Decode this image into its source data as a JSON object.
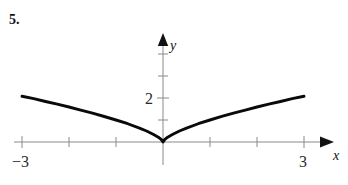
{
  "figure": {
    "problem_number": "5.",
    "axis_labels": {
      "x": "x",
      "y": "y"
    },
    "tick_labels": {
      "x_left": "−3",
      "x_right": "3",
      "y_two": "2"
    }
  },
  "colors": {
    "curve": "#0a0a0a",
    "axis": "#8a8a8a",
    "text": "#111111",
    "background": "#ffffff"
  },
  "chart_data": {
    "type": "line",
    "title": "",
    "xlabel": "x",
    "ylabel": "y",
    "xlim": [
      -3.35,
      3.35
    ],
    "ylim": [
      -0.45,
      3.1
    ],
    "grid": false,
    "legend": null,
    "xticks": [
      -3,
      -2,
      -1,
      0,
      1,
      2,
      3
    ],
    "xtick_labels": [
      "−3",
      "",
      "",
      "",
      "",
      "",
      "3"
    ],
    "yticks": [
      1,
      2,
      3,
      4
    ],
    "ytick_labels": [
      "",
      "2",
      "",
      ""
    ],
    "series": [
      {
        "name": "y = |x|^(2/3)",
        "x": [
          -3.0,
          -2.75,
          -2.5,
          -2.25,
          -2.0,
          -1.75,
          -1.5,
          -1.25,
          -1.0,
          -0.75,
          -0.5,
          -0.35,
          -0.2,
          -0.1,
          -0.04,
          0.0,
          0.04,
          0.1,
          0.2,
          0.35,
          0.5,
          0.75,
          1.0,
          1.25,
          1.5,
          1.75,
          2.0,
          2.25,
          2.5,
          2.75,
          3.0
        ],
        "y": [
          2.08,
          1.97,
          1.84,
          1.72,
          1.59,
          1.45,
          1.31,
          1.16,
          1.0,
          0.83,
          0.63,
          0.5,
          0.34,
          0.22,
          0.12,
          0.0,
          0.12,
          0.22,
          0.34,
          0.5,
          0.63,
          0.83,
          1.0,
          1.16,
          1.31,
          1.45,
          1.59,
          1.72,
          1.84,
          1.97,
          2.08
        ]
      }
    ],
    "annotations": [
      {
        "text": "cusp at origin",
        "x": 0,
        "y": 0
      }
    ]
  }
}
